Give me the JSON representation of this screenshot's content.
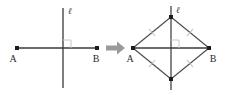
{
  "figure": {
    "colors": {
      "line_dark": "#3a3a3a",
      "line_mid": "#6f6f6f",
      "tick_light": "#b9b9b9",
      "arrow": "#9a9a9a",
      "point": "#1c1c1c",
      "label": "#2b2b2b",
      "background": "#ffffff"
    }
  },
  "left_panel": {
    "name": "before-construction",
    "line_label": "ℓ",
    "point_a_label": "A",
    "point_b_label": "B",
    "right_angle_marker": "∟",
    "description": "Segment AB crossed at its midpoint by vertical line ℓ at a right angle"
  },
  "arrow": {
    "glyph": "➜",
    "direction": "right",
    "label": "transforms into"
  },
  "right_panel": {
    "name": "after-construction",
    "line_label": "ℓ",
    "point_a_label": "A",
    "point_b_label": "B",
    "right_angle_marker": "∟",
    "tick_marks": [
      {
        "edge": "A-top",
        "count": 1
      },
      {
        "edge": "top-B",
        "count": 1
      },
      {
        "edge": "A-bottom",
        "count": 1
      },
      {
        "edge": "bottom-B",
        "count": 1
      }
    ],
    "description": "Rhombus with vertices A, top point on ℓ, B, and bottom point on ℓ; all four sides marked congruent"
  }
}
